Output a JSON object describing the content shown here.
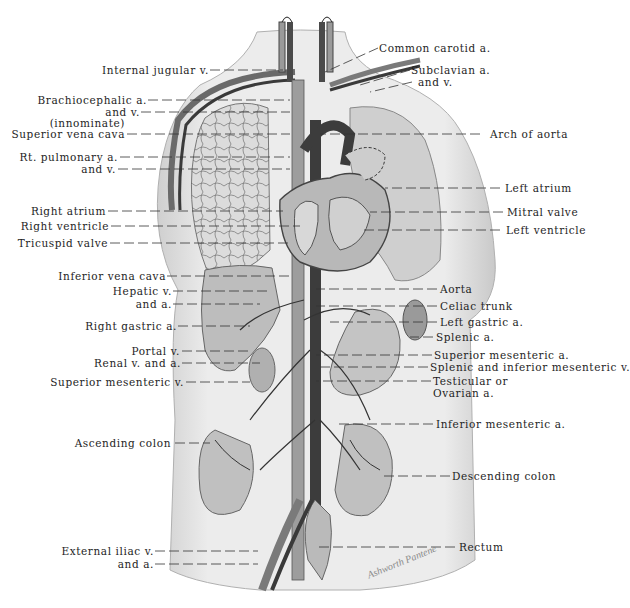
{
  "diagram": {
    "type": "anatomical-illustration",
    "colors": {
      "background": "#ffffff",
      "skin": "#e4e4e4",
      "organ": "#b8b8b8",
      "vein": "#6e6e6e",
      "artery": "#3a3a3a",
      "label": "#1e1e1e"
    },
    "signature": "Ashworth Pantene",
    "labels_left": [
      {
        "id": "internal-jugular-v",
        "text": "Internal jugular v."
      },
      {
        "id": "brachiocephalic-a",
        "text": "Brachiocephalic a."
      },
      {
        "id": "brachiocephalic-v",
        "text": "and v."
      },
      {
        "id": "innominate",
        "text": "(innominate)"
      },
      {
        "id": "superior-vena-cava",
        "text": "Superior vena cava"
      },
      {
        "id": "rt-pulmonary-a",
        "text": "Rt. pulmonary a."
      },
      {
        "id": "rt-pulmonary-v",
        "text": "and v."
      },
      {
        "id": "right-atrium",
        "text": "Right  atrium"
      },
      {
        "id": "right-ventricle",
        "text": "Right ventricle"
      },
      {
        "id": "tricuspid-valve",
        "text": "Tricuspid valve"
      },
      {
        "id": "inferior-vena-cava",
        "text": "Inferior vena cava"
      },
      {
        "id": "hepatic-v",
        "text": "Hepatic v."
      },
      {
        "id": "hepatic-a",
        "text": "and a."
      },
      {
        "id": "right-gastric-a",
        "text": "Right gastric a."
      },
      {
        "id": "portal-v",
        "text": "Portal v."
      },
      {
        "id": "renal-v-a",
        "text": "Renal v. and a."
      },
      {
        "id": "superior-mesenteric-v",
        "text": "Superior mesenteric v."
      },
      {
        "id": "ascending-colon",
        "text": "Ascending colon"
      },
      {
        "id": "external-iliac-v",
        "text": "External iliac v."
      },
      {
        "id": "external-iliac-a",
        "text": "and a."
      }
    ],
    "labels_right": [
      {
        "id": "common-carotid-a",
        "text": "Common carotid a."
      },
      {
        "id": "subclavian-a",
        "text": "Subclavian a."
      },
      {
        "id": "subclavian-v",
        "text": "and v."
      },
      {
        "id": "arch-of-aorta",
        "text": "Arch of aorta"
      },
      {
        "id": "left-atrium",
        "text": "Left atrium"
      },
      {
        "id": "mitral-valve",
        "text": "Mitral valve"
      },
      {
        "id": "left-ventricle",
        "text": "Left ventricle"
      },
      {
        "id": "aorta",
        "text": "Aorta"
      },
      {
        "id": "celiac-trunk",
        "text": "Celiac trunk"
      },
      {
        "id": "left-gastric-a",
        "text": "Left gastric a."
      },
      {
        "id": "splenic-a",
        "text": "Splenic a."
      },
      {
        "id": "superior-mesenteric-a",
        "text": "Superior mesenteric a."
      },
      {
        "id": "splenic-inferior-mesenteric-v",
        "text": "Splenic and inferior mesenteric v."
      },
      {
        "id": "testicular",
        "text": "Testicular  or"
      },
      {
        "id": "ovarian-a",
        "text": "Ovarian a."
      },
      {
        "id": "inferior-mesenteric-a",
        "text": "Inferior mesenteric a."
      },
      {
        "id": "descending-colon",
        "text": "Descending colon"
      },
      {
        "id": "rectum",
        "text": "Rectum"
      }
    ]
  }
}
